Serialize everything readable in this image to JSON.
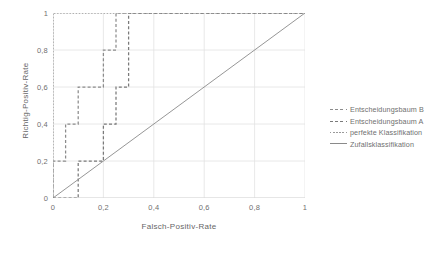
{
  "chart_data": {
    "type": "line",
    "title": "",
    "xlabel": "Falsch-Positiv-Rate",
    "ylabel": "Richtig-Positiv-Rate",
    "xlim": [
      0,
      1
    ],
    "ylim": [
      0,
      1
    ],
    "xticks": [
      "0",
      "0,2",
      "0,4",
      "0,6",
      "0,8",
      "1"
    ],
    "xtick_values": [
      0,
      0.2,
      0.4,
      0.6,
      0.8,
      1
    ],
    "yticks": [
      "0",
      "0,2",
      "0,4",
      "0,6",
      "0,8",
      "1"
    ],
    "ytick_values": [
      0,
      0.2,
      0.4,
      0.6,
      0.8,
      1
    ],
    "grid": true,
    "legend_position": "right",
    "series": [
      {
        "name": "Entscheidungsbaum B",
        "style": "dashed",
        "color": "#8c8c8c",
        "points": [
          [
            0.0,
            0.0
          ],
          [
            0.0,
            0.2
          ],
          [
            0.05,
            0.2
          ],
          [
            0.05,
            0.4
          ],
          [
            0.1,
            0.4
          ],
          [
            0.1,
            0.6
          ],
          [
            0.2,
            0.6
          ],
          [
            0.2,
            0.8
          ],
          [
            0.25,
            0.8
          ],
          [
            0.25,
            1.0
          ],
          [
            1.0,
            1.0
          ]
        ]
      },
      {
        "name": "Entscheidungsbaum A",
        "style": "dashed",
        "color": "#7a7a7a",
        "points": [
          [
            0.0,
            0.0
          ],
          [
            0.1,
            0.0
          ],
          [
            0.1,
            0.2
          ],
          [
            0.2,
            0.2
          ],
          [
            0.2,
            0.4
          ],
          [
            0.25,
            0.4
          ],
          [
            0.25,
            0.6
          ],
          [
            0.3,
            0.6
          ],
          [
            0.3,
            0.8
          ],
          [
            0.3,
            1.0
          ],
          [
            1.0,
            1.0
          ]
        ]
      },
      {
        "name": "perfekte Klassifikation",
        "style": "dotted",
        "color": "#9a9a9a",
        "points": [
          [
            0.0,
            0.0
          ],
          [
            0.0,
            1.0
          ],
          [
            1.0,
            1.0
          ]
        ]
      },
      {
        "name": "Zufallsklassifikation",
        "style": "solid",
        "color": "#8a8a8a",
        "points": [
          [
            0.0,
            0.0
          ],
          [
            1.0,
            1.0
          ]
        ]
      }
    ]
  },
  "legend": {
    "items": [
      {
        "label": "Entscheidungsbaum B",
        "style": "dashed",
        "color": "#8c8c8c"
      },
      {
        "label": "Entscheidungsbaum A",
        "style": "dashed",
        "color": "#7a7a7a"
      },
      {
        "label": "perfekte Klassifikation",
        "style": "dotted",
        "color": "#9a9a9a"
      },
      {
        "label": "Zufallsklassifikation",
        "style": "solid",
        "color": "#8a8a8a"
      }
    ]
  },
  "colors": {
    "grid": "#e2e2e2",
    "axis": "#d4d4d4",
    "text": "#6f6f6f",
    "background": "#ffffff"
  }
}
